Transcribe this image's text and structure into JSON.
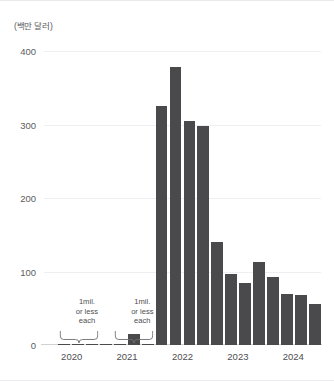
{
  "chart_data": {
    "type": "bar",
    "title": "",
    "subtitle": "",
    "unit_label": "(백만 달러)",
    "ylabel": "",
    "xlabel": "",
    "ylim": [
      0,
      400
    ],
    "yticks": [
      0,
      100,
      200,
      300,
      400
    ],
    "ytick_labels": [
      "0",
      "100",
      "200",
      "300",
      "400"
    ],
    "grid": true,
    "grid_axis": "y",
    "legend": "none",
    "bar_color": "#4a4a4d",
    "categories": [
      "2020 Q1",
      "2020 Q2",
      "2020 Q3",
      "2020 Q4",
      "2021 Q1",
      "2021 Q2",
      "2021 Q3",
      "2021 Q4",
      "2022 Q1",
      "2022 Q2",
      "2022 Q3",
      "2022 Q4",
      "2023 Q1",
      "2023 Q2",
      "2023 Q3",
      "2023 Q4",
      "2024 Q1",
      "2024 Q2",
      "2024 Q3",
      "2024 Q4"
    ],
    "values": [
      0,
      1,
      1,
      1,
      1,
      1,
      15,
      1,
      325,
      378,
      305,
      298,
      140,
      97,
      85,
      113,
      92,
      70,
      68,
      56
    ],
    "xtick_groups": [
      {
        "label": "2020",
        "center_index": 1.5
      },
      {
        "label": "2021",
        "center_index": 5.5
      },
      {
        "label": "2022",
        "center_index": 9.5
      },
      {
        "label": "2023",
        "center_index": 13.5
      },
      {
        "label": "2024",
        "center_index": 17.5
      }
    ],
    "annotations": [
      {
        "id": "annotation-left",
        "lines": [
          "1mil.",
          "or less",
          "each"
        ],
        "text": "1mil. or less each",
        "brace_from_index": 1,
        "brace_to_index": 4,
        "center_index": 2.6
      },
      {
        "id": "annotation-right",
        "lines": [
          "1mil.",
          "or less",
          "each"
        ],
        "text": "1mil. or less each",
        "brace_from_index": 5,
        "brace_to_index": 8,
        "center_index": 6.6
      }
    ]
  },
  "colors": {
    "bar": "#4a4a4d",
    "grid": "#efeff1",
    "axis": "#d2d2d6",
    "text": "#4e4e52",
    "background": "#ffffff"
  }
}
